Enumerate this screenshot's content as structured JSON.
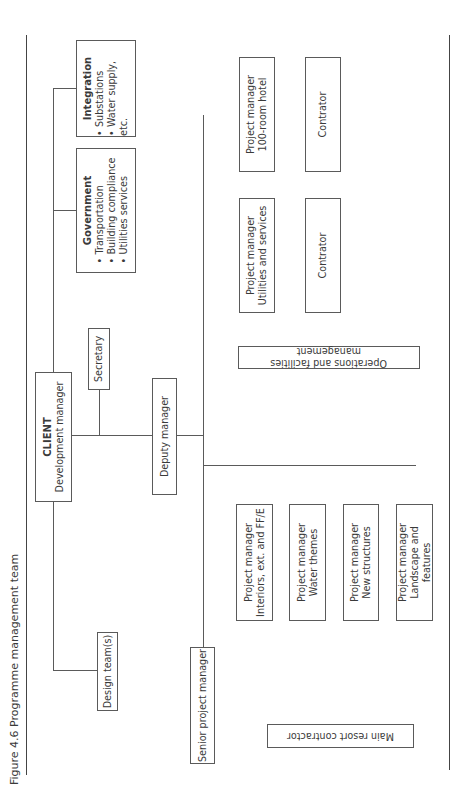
{
  "figure": {
    "title": "Figure 4.6  Programme management team"
  },
  "nodes": {
    "client": {
      "heading": "CLIENT",
      "label": "Development manager"
    },
    "secretary": {
      "label": "Secretary"
    },
    "deputy_manager": {
      "label": "Deputy manager"
    },
    "design_teams": {
      "label": "Design team(s)"
    },
    "government": {
      "heading": "Government",
      "items": [
        "Transportation",
        "Building compliance",
        "Utilities services"
      ]
    },
    "integration": {
      "heading": "Integration",
      "items": [
        "Substations",
        "Water supply, etc."
      ]
    },
    "senior_pm": {
      "label": "Senior project manager"
    },
    "main_resort_contractor": {
      "label": "Main resort contractor"
    },
    "operations_facilities": {
      "label": "Operations and facilities management"
    },
    "pm_utilities": {
      "line1": "Project manager",
      "line2": "Utilities and services"
    },
    "pm_hotel": {
      "line1": "Project manager",
      "line2": "100-room hotel"
    },
    "contractor_utilities": {
      "label": "Contrator"
    },
    "contractor_hotel": {
      "label": "Contrator"
    },
    "deputy_pms": [
      {
        "line1": "Project manager",
        "line2": "Interiors, ext. and FF/E"
      },
      {
        "line1": "Project manager",
        "line2": "Water themes"
      },
      {
        "line1": "Project manager",
        "line2": "New structures"
      },
      {
        "line1": "Project manager",
        "line2": "Landscape and features"
      }
    ],
    "senior_pms": [
      {
        "line1": "Project manager",
        "line2": "Interiors, ext. and FF/E"
      },
      {
        "line1": "Project manager",
        "line2": "Water themes"
      },
      {
        "line1": "Project manager",
        "line2": "New structures"
      },
      {
        "line1": "Project manager",
        "line2": "Landscape and features"
      }
    ]
  },
  "style": {
    "line_color": "#5a5a5a",
    "dash_color": "#7a7a7a",
    "orientation": "rotated 90° counter-clockwise"
  }
}
